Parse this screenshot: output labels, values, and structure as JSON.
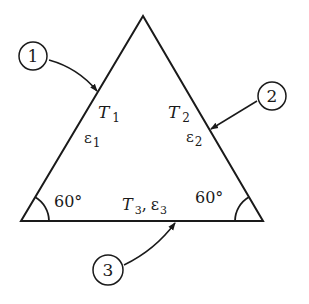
{
  "diagram": {
    "shape": "equilateral triangle",
    "surfaces": [
      {
        "id": "1",
        "label": "1",
        "temperature": "T",
        "temperature_sub": "1",
        "emissivity": "ε",
        "emissivity_sub": "1"
      },
      {
        "id": "2",
        "label": "2",
        "temperature": "T",
        "temperature_sub": "2",
        "emissivity": "ε",
        "emissivity_sub": "2"
      },
      {
        "id": "3",
        "label": "3",
        "temperature": "T",
        "temperature_sub": "3",
        "emissivity": "ε",
        "emissivity_sub": "3",
        "separator": ","
      }
    ],
    "angles": {
      "left": "60°",
      "right": "60°"
    },
    "colors": {
      "stroke": "#1a1a1a",
      "background": "#ffffff"
    }
  }
}
